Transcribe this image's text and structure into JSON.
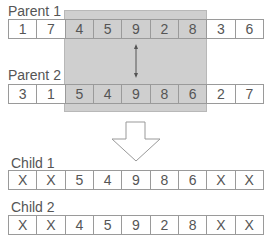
{
  "parent1": {
    "label": "Parent 1",
    "genes": [
      "1",
      "7",
      "4",
      "5",
      "9",
      "2",
      "8",
      "3",
      "6"
    ]
  },
  "parent2": {
    "label": "Parent 2",
    "genes": [
      "3",
      "1",
      "5",
      "4",
      "9",
      "8",
      "6",
      "2",
      "7"
    ]
  },
  "child1": {
    "label": "Child 1",
    "genes": [
      "X",
      "X",
      "5",
      "4",
      "9",
      "8",
      "6",
      "X",
      "X"
    ]
  },
  "child2": {
    "label": "Child 2",
    "genes": [
      "X",
      "X",
      "4",
      "5",
      "9",
      "2",
      "8",
      "X",
      "X"
    ]
  },
  "crossover_segment": {
    "start_index": 2,
    "end_index": 6
  },
  "colors": {
    "shade": "#cfcfcf",
    "border": "#9a9a9a",
    "text": "#555555"
  }
}
